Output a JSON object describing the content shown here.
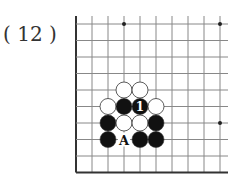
{
  "figure": {
    "label": "( 12 )"
  },
  "board": {
    "region": "bottom-left corner",
    "grid": {
      "origin_x": 76,
      "origin_y": 24,
      "spacing_x": 16,
      "spacing_y": 16.5,
      "cols": 10,
      "rows": 10,
      "edges": [
        "left",
        "bottom"
      ]
    },
    "colors": {
      "line": "#888888",
      "edge": "#333333",
      "black_stone": "#111111",
      "white_stone": "#ffffff",
      "stone_outline": "#333333"
    },
    "star_points": [
      {
        "col": 3,
        "row": 0
      },
      {
        "col": 9,
        "row": 0
      },
      {
        "col": 9,
        "row": 6
      }
    ],
    "stones": [
      {
        "col": 3,
        "row": 4,
        "color": "white"
      },
      {
        "col": 4,
        "row": 4,
        "color": "white"
      },
      {
        "col": 2,
        "row": 5,
        "color": "white"
      },
      {
        "col": 3,
        "row": 5,
        "color": "black"
      },
      {
        "col": 4,
        "row": 5,
        "color": "black",
        "label": "1"
      },
      {
        "col": 5,
        "row": 5,
        "color": "white"
      },
      {
        "col": 2,
        "row": 6,
        "color": "black"
      },
      {
        "col": 3,
        "row": 6,
        "color": "white"
      },
      {
        "col": 4,
        "row": 6,
        "color": "white"
      },
      {
        "col": 5,
        "row": 6,
        "color": "black"
      },
      {
        "col": 2,
        "row": 7,
        "color": "black"
      },
      {
        "col": 4,
        "row": 7,
        "color": "black"
      },
      {
        "col": 5,
        "row": 7,
        "color": "black"
      }
    ],
    "markers": [
      {
        "col": 3,
        "row": 7,
        "text": "A"
      }
    ]
  }
}
